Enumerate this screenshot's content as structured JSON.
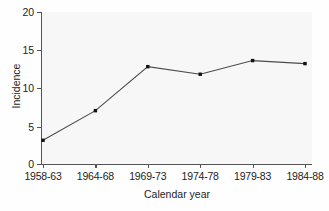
{
  "chart_data": {
    "type": "line",
    "title": "",
    "xlabel": "Calendar year",
    "ylabel": "Incidence",
    "categories": [
      "1958-63",
      "1964-68",
      "1969-73",
      "1974-78",
      "1979-83",
      "1984-88"
    ],
    "values": [
      3.1,
      7.0,
      12.8,
      11.8,
      13.6,
      13.2
    ],
    "series": [
      {
        "name": "Incidence",
        "values": [
          3.1,
          7.0,
          12.8,
          11.8,
          13.6,
          13.2
        ]
      }
    ],
    "ylim": [
      0,
      20
    ],
    "yticks": [
      0,
      5,
      10,
      15,
      20
    ],
    "ytick_labels": [
      "0",
      "5",
      "10",
      "15",
      "20"
    ],
    "grid": false,
    "legend": false,
    "legend_position": "none",
    "marker": "square",
    "line_color": "#4a4a4a",
    "marker_color": "#111111",
    "axis_color": "#555555",
    "plot_background": "#f7f7f7"
  },
  "axes": {
    "y_title": "Incidence",
    "x_title": "Calendar year",
    "y_tick_labels": [
      "20",
      "15",
      "10",
      "5",
      "0"
    ],
    "x_tick_labels": [
      "1958-63",
      "1964-68",
      "1969-73",
      "1974-78",
      "1979-83",
      "1984-88"
    ]
  }
}
